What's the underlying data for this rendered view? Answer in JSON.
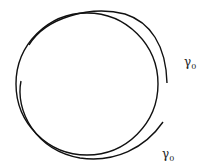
{
  "diagram": {
    "main_circle": {
      "cx": 87,
      "cy": 84,
      "r": 71,
      "color": "#111111"
    },
    "labels": [
      {
        "text": "γ",
        "sub": "0",
        "x": 184,
        "y": 56
      },
      {
        "text": "γ",
        "sub": "0",
        "x": 162,
        "y": 148
      }
    ]
  }
}
